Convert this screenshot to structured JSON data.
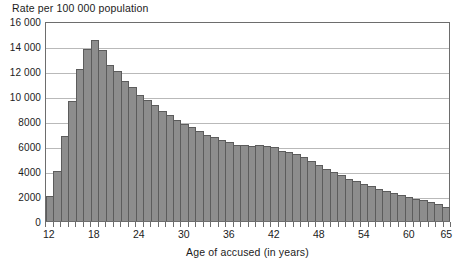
{
  "chart_data": {
    "type": "bar",
    "title": "Rate per 100 000 population",
    "xlabel": "Age of accused (in years)",
    "ylabel": "",
    "xlim": [
      12,
      65
    ],
    "ylim": [
      0,
      16000
    ],
    "ytick_labels": [
      "16 000",
      "14 000",
      "12 000",
      "10 000",
      "8000",
      "6000",
      "4000",
      "2000",
      "0"
    ],
    "ytick_values": [
      16000,
      14000,
      12000,
      10000,
      8000,
      6000,
      4000,
      2000,
      0
    ],
    "xtick_labels": [
      "12",
      "18",
      "24",
      "30",
      "36",
      "42",
      "48",
      "54",
      "60",
      "65"
    ],
    "xtick_values": [
      12,
      18,
      24,
      30,
      36,
      42,
      48,
      54,
      60,
      65
    ],
    "grid": true,
    "legend": "none",
    "bar_color": "#8d8d8d",
    "bar_edge_color": "#5c5c5c",
    "grid_color": "#b9b9b9",
    "axis_color": "#6d6d6d",
    "categories": [
      12,
      13,
      14,
      15,
      16,
      17,
      18,
      19,
      20,
      21,
      22,
      23,
      24,
      25,
      26,
      27,
      28,
      29,
      30,
      31,
      32,
      33,
      34,
      35,
      36,
      37,
      38,
      39,
      40,
      41,
      42,
      43,
      44,
      45,
      46,
      47,
      48,
      49,
      50,
      51,
      52,
      53,
      54,
      55,
      56,
      57,
      58,
      59,
      60,
      61,
      62,
      63,
      64,
      65
    ],
    "values": [
      2000,
      4000,
      6800,
      9600,
      12200,
      13800,
      14500,
      13700,
      12500,
      12000,
      11200,
      10700,
      10100,
      9700,
      9300,
      8800,
      8500,
      8100,
      7800,
      7500,
      7200,
      6900,
      6700,
      6500,
      6300,
      6100,
      6050,
      6000,
      6050,
      6000,
      5950,
      5600,
      5500,
      5400,
      5100,
      4800,
      4500,
      4200,
      3900,
      3650,
      3400,
      3200,
      3000,
      2800,
      2600,
      2400,
      2250,
      2100,
      1950,
      1800,
      1650,
      1500,
      1350,
      1100
    ]
  }
}
